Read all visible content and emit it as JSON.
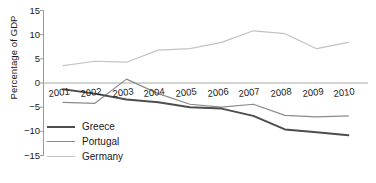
{
  "chart_data": {
    "type": "line",
    "title": "",
    "xlabel": "",
    "ylabel": "Percentage of GDP",
    "categories": [
      "2001",
      "2002",
      "2003",
      "2004",
      "2005",
      "2006",
      "2007",
      "2008",
      "2009",
      "2010"
    ],
    "x": [
      2001,
      2002,
      2003,
      2004,
      2005,
      2006,
      2007,
      2008,
      2009,
      2010
    ],
    "ylim": [
      -15,
      15
    ],
    "yticks": [
      15,
      10,
      5,
      0,
      -5,
      -10,
      -15
    ],
    "ytick_labels": [
      "15",
      "10",
      "5",
      "0",
      "−5",
      "−10",
      "−15"
    ],
    "grid": false,
    "zero_line": true,
    "legend_position": "lower-left-inside",
    "series": [
      {
        "name": "Greece",
        "color": "#4d4d4d",
        "width": 2.0,
        "values": [
          -1.3,
          -2.2,
          -3.4,
          -4.0,
          -5.0,
          -5.3,
          -6.8,
          -9.6,
          -10.2,
          -10.8
        ]
      },
      {
        "name": "Portugal",
        "color": "#8a8a8a",
        "width": 1.2,
        "values": [
          -4.0,
          -4.2,
          0.8,
          -2.2,
          -4.4,
          -5.0,
          -4.4,
          -6.7,
          -7.0,
          -6.8
        ]
      },
      {
        "name": "Germany",
        "color": "#c2c2c2",
        "width": 1.2,
        "values": [
          3.6,
          4.5,
          4.3,
          6.8,
          7.1,
          8.4,
          10.8,
          10.2,
          7.1,
          8.4
        ]
      }
    ]
  },
  "axes": {
    "ylabel": "Percentage of GDP"
  },
  "legend": {
    "items": [
      {
        "label": "Greece"
      },
      {
        "label": "Portugal"
      },
      {
        "label": "Germany"
      }
    ]
  },
  "colors": {
    "greece": "#4d4d4d",
    "portugal": "#8a8a8a",
    "germany": "#c2c2c2",
    "axis": "#9a9a9a",
    "text": "#1a1a1a"
  }
}
